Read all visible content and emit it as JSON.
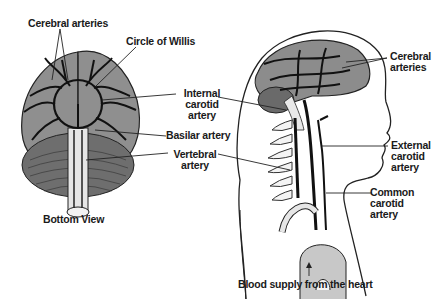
{
  "diagram": {
    "views": {
      "left": {
        "caption": "Bottom View"
      },
      "right": {
        "caption": "Side view of head and neck"
      }
    },
    "labels": {
      "cerebral_arteries_left": "Cerebral arteries",
      "circle_of_willis": "Circle of Willis",
      "internal_carotid_1": "Internal",
      "internal_carotid_2": "carotid",
      "internal_carotid_3": "artery",
      "basilar_artery": "Basilar artery",
      "vertebral_1": "Vertebral",
      "vertebral_2": "artery",
      "cerebral_right_1": "Cerebral",
      "cerebral_right_2": "arteries",
      "external_carotid_1": "External",
      "external_carotid_2": "carotid",
      "external_carotid_3": "artery",
      "common_carotid_1": "Common",
      "common_carotid_2": "carotid",
      "common_carotid_3": "artery",
      "blood_supply": "Blood supply from the heart",
      "bottom_view": "Bottom View"
    },
    "colors": {
      "brain_fill": "#8c8c8c",
      "cerebellum_fill": "#6e6e6e",
      "artery_stroke": "#1a1a1a",
      "aorta_fill": "#c8c8c8",
      "background": "#ffffff"
    }
  }
}
